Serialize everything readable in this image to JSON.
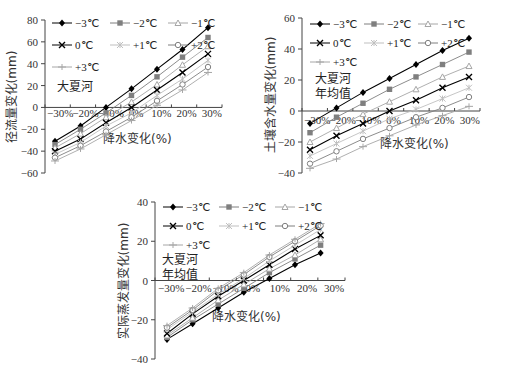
{
  "chart_data": [
    {
      "type": "line",
      "title": "",
      "annotation": "大夏河",
      "xlabel": "降水变化(%)",
      "ylabel": "径流量变化(mm)",
      "x": [
        -30,
        -20,
        -10,
        0,
        10,
        20,
        30
      ],
      "x_tick_labels": [
        "-30%",
        "-20%",
        "-10%",
        "0%",
        "10%",
        "20%",
        "30%"
      ],
      "y_ticks": [
        80,
        60,
        40,
        20,
        0,
        -20,
        -40,
        -60
      ],
      "ylim": [
        -60,
        80
      ],
      "grid": false,
      "legend_position": "upper-left",
      "series": [
        {
          "name": "-3℃",
          "marker": "diamond",
          "color": "#000000",
          "values": [
            -31,
            -17,
            0,
            17,
            35,
            53,
            73
          ]
        },
        {
          "name": "-2℃",
          "marker": "square",
          "color": "#7f7f7f",
          "values": [
            -34,
            -20,
            -5,
            11,
            28,
            46,
            64
          ]
        },
        {
          "name": "-1℃",
          "marker": "triangle",
          "color": "#a6a6a6",
          "values": [
            -37,
            -24,
            -9,
            5,
            21,
            39,
            56
          ]
        },
        {
          "name": "0℃",
          "marker": "x",
          "color": "#000000",
          "values": [
            -40,
            -29,
            -14,
            0,
            16,
            32,
            49
          ]
        },
        {
          "name": "+1℃",
          "marker": "star",
          "color": "#bfbfbf",
          "values": [
            -43,
            -32,
            -17,
            -5,
            11,
            26,
            43
          ]
        },
        {
          "name": "+2℃",
          "marker": "circle",
          "color": "#7f7f7f",
          "values": [
            -46,
            -35,
            -22,
            -9,
            6,
            21,
            37
          ]
        },
        {
          "name": "+3℃",
          "marker": "plus",
          "color": "#a6a6a6",
          "values": [
            -49,
            -38,
            -25,
            -12,
            2,
            16,
            32
          ]
        }
      ]
    },
    {
      "type": "line",
      "title": "",
      "annotation": "大夏河\n年均值",
      "annotation_lines": [
        "大夏河",
        "年均值"
      ],
      "xlabel": "降水变化(%)",
      "ylabel": "土壤含水量变化(mm)",
      "x": [
        -30,
        -20,
        -10,
        0,
        10,
        20,
        30
      ],
      "x_tick_labels": [
        "-30%",
        "-20%",
        "-10%",
        "0%",
        "10%",
        "20%",
        "30%"
      ],
      "y_ticks": [
        60,
        40,
        20,
        0,
        -20,
        -40
      ],
      "ylim": [
        -40,
        60
      ],
      "grid": false,
      "legend_position": "upper-left",
      "series": [
        {
          "name": "-3℃",
          "marker": "diamond",
          "color": "#000000",
          "values": [
            -8,
            2,
            12,
            21,
            30,
            39,
            47
          ]
        },
        {
          "name": "-2℃",
          "marker": "square",
          "color": "#7f7f7f",
          "values": [
            -14,
            -4,
            5,
            14,
            22,
            30,
            38
          ]
        },
        {
          "name": "-1℃",
          "marker": "triangle",
          "color": "#a6a6a6",
          "values": [
            -20,
            -11,
            -2,
            6,
            14,
            22,
            29
          ]
        },
        {
          "name": "0℃",
          "marker": "x",
          "color": "#000000",
          "values": [
            -25,
            -16,
            -8,
            0,
            7,
            15,
            22
          ]
        },
        {
          "name": "+1℃",
          "marker": "star",
          "color": "#bfbfbf",
          "values": [
            -29,
            -21,
            -13,
            -5,
            1,
            8,
            15
          ]
        },
        {
          "name": "+2℃",
          "marker": "circle",
          "color": "#7f7f7f",
          "values": [
            -34,
            -26,
            -18,
            -11,
            -4,
            2,
            9
          ]
        },
        {
          "name": "+3℃",
          "marker": "plus",
          "color": "#a6a6a6",
          "values": [
            -37,
            -31,
            -23,
            -16,
            -9,
            -3,
            3
          ]
        }
      ]
    },
    {
      "type": "line",
      "title": "",
      "annotation": "大夏河\n年均值",
      "annotation_lines": [
        "大夏河",
        "年均值"
      ],
      "xlabel": "降水变化(%)",
      "ylabel": "实际蒸发量变化(mm)",
      "x": [
        -30,
        -20,
        -10,
        0,
        10,
        20,
        30
      ],
      "x_tick_labels": [
        "-30%",
        "-20%",
        "-10%",
        "0%",
        "10%",
        "20%",
        "30%"
      ],
      "y_ticks": [
        40,
        20,
        0,
        -20,
        -40
      ],
      "ylim": [
        -40,
        40
      ],
      "grid": false,
      "legend_position": "upper-left",
      "series": [
        {
          "name": "-3℃",
          "marker": "diamond",
          "color": "#000000",
          "values": [
            -30,
            -22,
            -14,
            -6,
            1,
            8,
            14
          ]
        },
        {
          "name": "-2℃",
          "marker": "square",
          "color": "#7f7f7f",
          "values": [
            -29,
            -20,
            -12,
            -4,
            4,
            11,
            18
          ]
        },
        {
          "name": "-1℃",
          "marker": "triangle",
          "color": "#a6a6a6",
          "values": [
            -28,
            -19,
            -10,
            -2,
            6,
            13,
            21
          ]
        },
        {
          "name": "0℃",
          "marker": "x",
          "color": "#000000",
          "values": [
            -27,
            -17,
            -8,
            0,
            8,
            16,
            23
          ]
        },
        {
          "name": "+1℃",
          "marker": "star",
          "color": "#bfbfbf",
          "values": [
            -25,
            -16,
            -7,
            1,
            10,
            18,
            26
          ]
        },
        {
          "name": "+2℃",
          "marker": "circle",
          "color": "#7f7f7f",
          "values": [
            -24,
            -15,
            -5,
            3,
            12,
            20,
            28
          ]
        },
        {
          "name": "+3℃",
          "marker": "plus",
          "color": "#a6a6a6",
          "values": [
            -23,
            -14,
            -4,
            4,
            13,
            21,
            29
          ]
        }
      ]
    }
  ]
}
